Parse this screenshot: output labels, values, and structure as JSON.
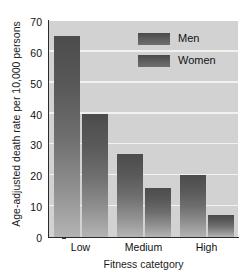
{
  "chart_data": {
    "type": "bar",
    "title": "",
    "xlabel": "Fitness catetgory",
    "ylabel": "Age-adjusted death rate per 10,000 persons",
    "categories": [
      "Low",
      "Medium",
      "High"
    ],
    "series": [
      {
        "name": "Men",
        "values": [
          65,
          27,
          20
        ]
      },
      {
        "name": "Women",
        "values": [
          40,
          16,
          7
        ]
      }
    ],
    "ylim": [
      0,
      70
    ],
    "yticks": [
      0,
      10,
      20,
      30,
      40,
      50,
      60,
      70
    ],
    "ytick_labels": [
      "0",
      "10",
      "20",
      "30",
      "40",
      "50",
      "60",
      "70"
    ],
    "grid": "horizontal-white",
    "legend_position": "top-right-inside",
    "colors": {
      "plot_background": "#d2d2d2",
      "gridline": "#f2f2f2",
      "bar_top": "#4c4c4c",
      "bar_bottom": "#b4b4b4",
      "axis": "#2b2b2b",
      "text": "#111111",
      "page_background": "#ffffff"
    }
  },
  "legend": {
    "items": [
      {
        "label": "Men"
      },
      {
        "label": "Women"
      }
    ]
  },
  "axes": {
    "y_title": "Age-adjusted death rate per 10,000 persons",
    "x_title": "Fitness catetgory",
    "y_ticks": [
      "70",
      "60",
      "50",
      "40",
      "30",
      "20",
      "10",
      "0"
    ],
    "x_ticks": [
      "Low",
      "Medium",
      "High"
    ]
  }
}
